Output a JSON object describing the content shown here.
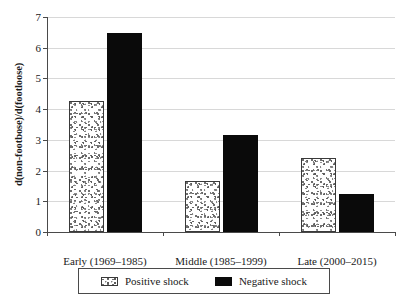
{
  "chart_data": {
    "type": "bar",
    "title": "",
    "subtitle": "",
    "xlabel": "",
    "ylabel": "d(non-footbose)/d(footloose)",
    "categories": [
      "Early (1969–1985)",
      "Middle (1985–1999)",
      "Late (2000–2015)"
    ],
    "series": [
      {
        "name": "Positive shock",
        "values": [
          4.25,
          1.67,
          2.42
        ],
        "color": "#ffffff",
        "pattern": "stipple"
      },
      {
        "name": "Negative shock",
        "values": [
          6.47,
          3.15,
          1.25
        ],
        "color": "#0a0a0a",
        "pattern": "solid"
      }
    ],
    "ylim": [
      0,
      7
    ],
    "ytick_labels": [
      "0",
      "1",
      "2",
      "3",
      "4",
      "5",
      "6",
      "7"
    ],
    "ytick_values": [
      0,
      1,
      2,
      3,
      4,
      5,
      6,
      7
    ],
    "grid": "horizontal",
    "legend_position": "bottom"
  },
  "legend": {
    "entries": [
      {
        "label": "Positive shock",
        "swatch": "stipple-swatch-icon"
      },
      {
        "label": "Negative shock",
        "swatch": "solid-black-swatch-icon"
      }
    ]
  },
  "colors": {
    "bar_negative": "#0a0a0a",
    "bar_positive_fill": "#ffffff",
    "bar_positive_stroke": "#3a3a3a",
    "axis": "#4a4a4a",
    "gridline": "#d8d8d8",
    "background": "#ffffff",
    "text": "#1a1a1a"
  }
}
